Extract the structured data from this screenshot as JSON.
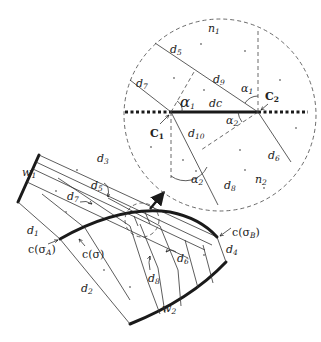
{
  "figure": {
    "colors": {
      "line": "#333333",
      "thick": "#1a1a1a",
      "background": "#ffffff"
    }
  },
  "main": {
    "walls": {
      "w1": "w",
      "w1_sub": "1",
      "w2": "w",
      "w2_sub": "2"
    },
    "lines": {
      "d1": "d",
      "d1_sub": "1",
      "d2": "d",
      "d2_sub": "2",
      "d3": "d",
      "d3_sub": "3",
      "d4": "d",
      "d4_sub": "4",
      "d5": "d",
      "d5_sub": "5",
      "d6": "d",
      "d6_sub": "6",
      "d7": "d",
      "d7_sub": "7",
      "d8": "d",
      "d8_sub": "8"
    },
    "curve": {
      "c_sigma": "c(σ)",
      "c_sigmaA": "c(σ",
      "c_sigmaA_sub": "A",
      "c_sigmaB": "c(σ",
      "c_sigmaB_sub": "B",
      "close_paren": ")"
    }
  },
  "inset": {
    "region_labels": {
      "n1": "n",
      "n1_sub": "1",
      "n2": "n",
      "n2_sub": "2"
    },
    "lines": {
      "d5": "d",
      "d5_sub": "5",
      "d6": "d",
      "d6_sub": "6",
      "d7": "d",
      "d7_sub": "7",
      "d8": "d",
      "d8_sub": "8",
      "d9": "d",
      "d9_sub": "9",
      "d10": "d",
      "d10_sub": "10"
    },
    "segment": {
      "dc": "dc"
    },
    "points": {
      "C1": "C",
      "C1_sub": "1",
      "C2": "C",
      "C2_sub": "2"
    },
    "angles": {
      "alpha1": "α",
      "alpha1_sub": "1",
      "alpha2": "α",
      "alpha2_sub": "2"
    }
  }
}
